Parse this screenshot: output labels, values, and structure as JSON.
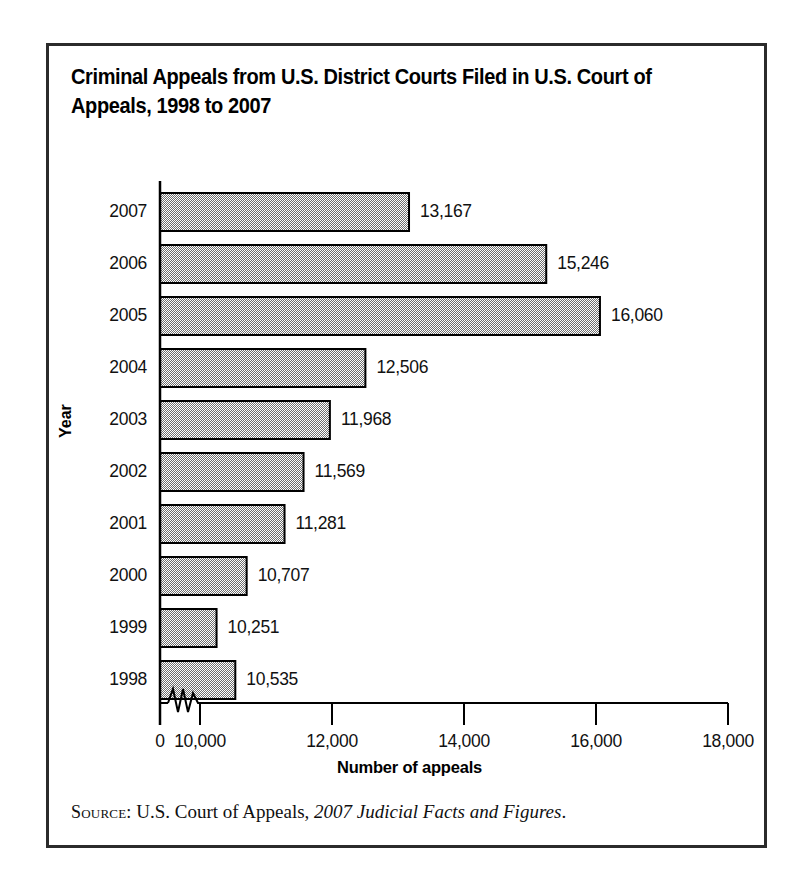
{
  "figure": {
    "title": "Criminal Appeals from U.S. District Courts Filed in U.S. Court of\nAppeals, 1998 to 2007",
    "source_kicker": "Source:",
    "source_roman": " U.S. Court of Appeals, ",
    "source_italic": "2007 Judicial Facts and Figures",
    "source_end": ".",
    "border_color": "#2b2b2b",
    "bar_fill_color": "#a8a8a8",
    "bar_outline_color": "#000000"
  },
  "chart_data": {
    "type": "bar",
    "orientation": "horizontal",
    "title": "Criminal Appeals from U.S. District Courts Filed in U.S. Court of Appeals, 1998 to 2007",
    "xlabel": "Number of appeals",
    "ylabel": "Year",
    "categories": [
      "2007",
      "2006",
      "2005",
      "2004",
      "2003",
      "2002",
      "2001",
      "2000",
      "1999",
      "1998"
    ],
    "values": [
      13167,
      15246,
      16060,
      12506,
      11968,
      11569,
      11281,
      10707,
      10251,
      10535
    ],
    "value_labels": [
      "13,167",
      "15,246",
      "16,060",
      "12,506",
      "11,968",
      "11,569",
      "11,281",
      "10,707",
      "10,251",
      "10,535"
    ],
    "xticks": [
      0,
      10000,
      12000,
      14000,
      16000,
      18000
    ],
    "xtick_labels": [
      "0",
      "10,000",
      "12,000",
      "14,000",
      "16,000",
      "18,000"
    ],
    "xlim": [
      0,
      18000
    ],
    "axis_break": true,
    "axis_break_between": [
      0,
      10000
    ],
    "grid": false,
    "legend": false
  }
}
